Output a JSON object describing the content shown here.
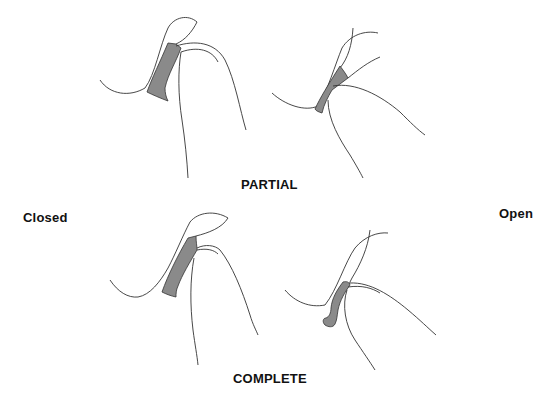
{
  "labels": {
    "partial": "PARTIAL",
    "complete": "COMPLETE",
    "closed": "Closed",
    "open": "Open"
  },
  "panels": [
    {
      "row": "PARTIAL",
      "state": "Closed",
      "position": "top-left"
    },
    {
      "row": "PARTIAL",
      "state": "Open",
      "position": "top-right"
    },
    {
      "row": "COMPLETE",
      "state": "Closed",
      "position": "bottom-left"
    },
    {
      "row": "COMPLETE",
      "state": "Open",
      "position": "bottom-right"
    }
  ],
  "colors": {
    "line": "#333333",
    "shade": "#8a8a8a",
    "text": "#111111",
    "background": "#ffffff"
  }
}
